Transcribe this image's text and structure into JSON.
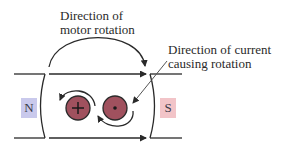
{
  "diagram": {
    "motor_label": {
      "line1": "Direction of",
      "line2": "motor rotation"
    },
    "current_label": {
      "line1": "Direction of current",
      "line2": "causing rotation"
    },
    "poles": {
      "north": {
        "label": "N",
        "color": "#c9c9ec"
      },
      "south": {
        "label": "S",
        "color": "#f2c4c8"
      }
    },
    "conductors": [
      {
        "symbol": "+",
        "meaning": "current into page",
        "fill": "#a0515e"
      },
      {
        "symbol": "•",
        "meaning": "current out of page",
        "fill": "#a0515e"
      }
    ],
    "line_color": "#2a2a2a"
  }
}
